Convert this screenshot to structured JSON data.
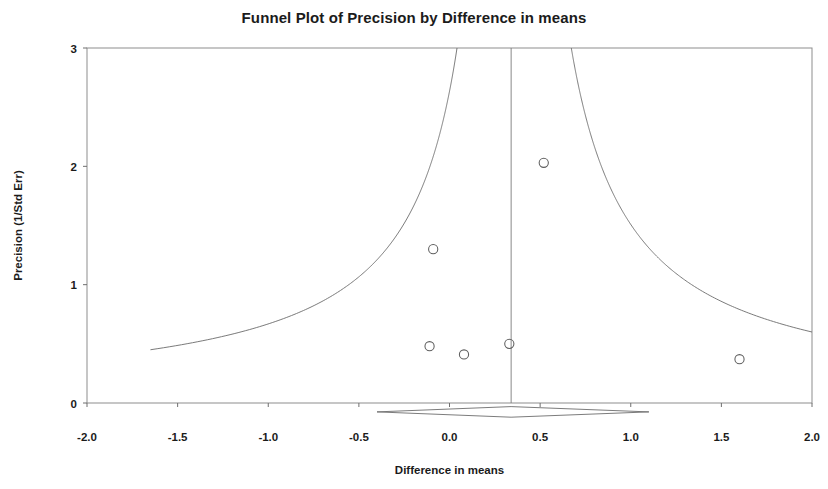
{
  "chart_data": {
    "type": "scatter",
    "title": "Funnel Plot of Precision by Difference in means",
    "xlabel": "Difference in means",
    "ylabel": "Precision (1/Std Err)",
    "xlim": [
      -2.0,
      2.0
    ],
    "ylim": [
      0,
      3
    ],
    "grid": false,
    "legend": "none",
    "xticks": [
      "-2.0",
      "-1.5",
      "-1.0",
      "-0.5",
      "0.0",
      "0.5",
      "1.0",
      "1.5",
      "2.0"
    ],
    "xtick_values": [
      -2.0,
      -1.5,
      -1.0,
      -0.5,
      0.0,
      0.5,
      1.0,
      1.5,
      2.0
    ],
    "yticks": [
      "0",
      "1",
      "2",
      "3"
    ],
    "ytick_values": [
      0,
      1,
      2,
      3
    ],
    "series": [
      {
        "name": "Studies",
        "marker": "open-circle",
        "points": [
          {
            "x": -0.09,
            "y": 1.3
          },
          {
            "x": -0.11,
            "y": 0.48
          },
          {
            "x": 0.08,
            "y": 0.41
          },
          {
            "x": 0.33,
            "y": 0.5
          },
          {
            "x": 0.52,
            "y": 2.03
          },
          {
            "x": 1.6,
            "y": 0.37
          }
        ]
      }
    ],
    "center_line": {
      "name": "Combined effect (vertical reference line)",
      "x": 0.34,
      "y_from": 0,
      "y_to": 3
    },
    "funnel_limits": {
      "name": "95% pseudo confidence limits",
      "z": 1.96,
      "center": 0.34,
      "left_curve_endpoint": {
        "x": -1.65,
        "y": 0.45
      },
      "right_curve_endpoint": {
        "x": 2.0,
        "y": 0.6
      },
      "apex": {
        "x": 0.34,
        "y": 3
      }
    },
    "summary_diamond": {
      "name": "Summary effect",
      "center_x": 0.34,
      "left_x": -0.4,
      "right_x": 1.1,
      "y_center": -0.075,
      "half_height": 0.045
    }
  },
  "axes": {
    "x_tick_labels": [
      "-2.0",
      "-1.5",
      "-1.0",
      "-0.5",
      "0.0",
      "0.5",
      "1.0",
      "1.5",
      "2.0"
    ],
    "y_tick_labels": [
      "3",
      "2",
      "1",
      "0"
    ],
    "x_axis_title": "Difference in means",
    "y_axis_title": "Precision (1/Std Err)"
  },
  "header": {
    "title": "Funnel Plot of Precision by Difference in means"
  },
  "colors": {
    "frame": "#8d8d8d",
    "curve": "#6b6b6b",
    "marker": "#5d5d5d",
    "text": "#1b1b1b",
    "background": "#ffffff"
  }
}
